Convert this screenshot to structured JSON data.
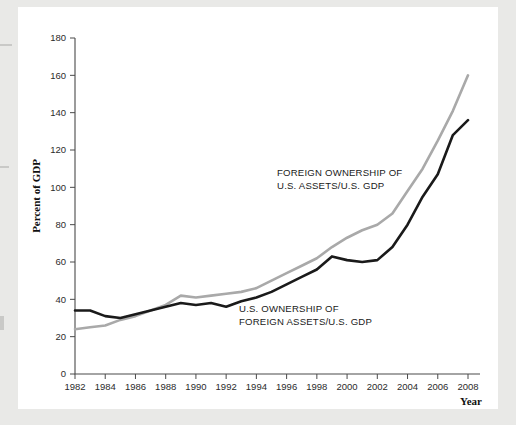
{
  "figure": {
    "y_axis_title": "Percent of GDP",
    "x_axis_title": "Year",
    "label_foreign_line1": "FOREIGN OWNERSHIP OF",
    "label_foreign_line2": "U.S. ASSETS/U.S. GDP",
    "label_us_line1": "U.S. OWNERSHIP OF",
    "label_us_line2": "FOREIGN ASSETS/U.S. GDP",
    "colors": {
      "foreign_line": "#a9a9a9",
      "us_line": "#1a1a1a",
      "axis": "#4a4a4a",
      "page": "#ffffff",
      "surround": "#e9e9e7"
    }
  },
  "chart_data": {
    "type": "line",
    "title": "",
    "xlabel": "Year",
    "ylabel": "Percent of GDP",
    "xlim": [
      1982,
      2008
    ],
    "ylim": [
      0,
      180
    ],
    "yticks": [
      0,
      20,
      40,
      60,
      80,
      100,
      120,
      140,
      160,
      180
    ],
    "xticks": [
      1982,
      1984,
      1986,
      1988,
      1990,
      1992,
      1994,
      1996,
      1998,
      2000,
      2002,
      2004,
      2006,
      2008
    ],
    "grid": false,
    "legend_position": "inline-annotation",
    "x": [
      1982,
      1983,
      1984,
      1985,
      1986,
      1987,
      1988,
      1989,
      1990,
      1991,
      1992,
      1993,
      1994,
      1995,
      1996,
      1997,
      1998,
      1999,
      2000,
      2001,
      2002,
      2003,
      2004,
      2005,
      2006,
      2007,
      2008
    ],
    "series": [
      {
        "name": "FOREIGN OWNERSHIP OF U.S. ASSETS/U.S. GDP",
        "color": "#a9a9a9",
        "values": [
          24,
          25,
          26,
          29,
          31,
          34,
          37,
          42,
          41,
          42,
          43,
          44,
          46,
          50,
          54,
          58,
          62,
          68,
          73,
          77,
          80,
          86,
          98,
          110,
          125,
          141,
          160
        ]
      },
      {
        "name": "U.S. OWNERSHIP OF FOREIGN ASSETS/U.S. GDP",
        "color": "#1a1a1a",
        "values": [
          34,
          34,
          31,
          30,
          32,
          34,
          36,
          38,
          37,
          38,
          36,
          39,
          41,
          44,
          48,
          52,
          56,
          63,
          61,
          60,
          61,
          68,
          80,
          95,
          107,
          128,
          136
        ]
      }
    ]
  }
}
